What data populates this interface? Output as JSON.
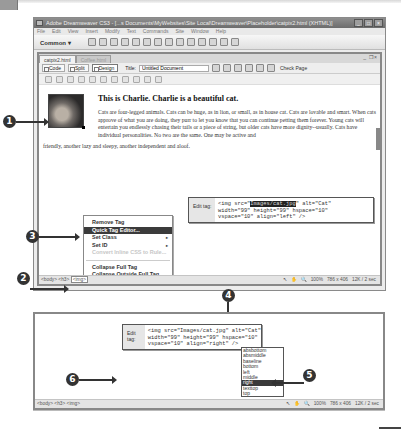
{
  "app": {
    "title": "Adobe Dreamweaver CS3 - [...s Documents\\MyWebsites\\Site Local\\Dreamweaver\\Placeholder\\catpix2.html (XHTML)]",
    "window_buttons": [
      "_",
      "□",
      "×"
    ],
    "menu": [
      "File",
      "Edit",
      "View",
      "Insert",
      "Modify",
      "Text",
      "Commands",
      "Site",
      "Window",
      "Help"
    ],
    "insert_bar": {
      "category": "Common ▾"
    }
  },
  "document": {
    "tabs": [
      {
        "label": "catpix2.html",
        "active": true
      },
      {
        "label": "Coffee.html",
        "active": false
      }
    ],
    "window_controls": "_  ❐ ×",
    "view_buttons": [
      "Code",
      "Split",
      "Design"
    ],
    "active_view": "Design",
    "title_label": "Title:",
    "title_value": "Untitled Document",
    "check_page": "Check Page",
    "heading": "This is Charlie. Charlie is a beautiful cat.",
    "paragraph_wrapped": "Cats are four-legged animals. Cats can be huge, as in lion, or small, as in house cat. Cats are lovable and smart. When cats approve of what you are doing, they purr to let you know that you can continue petting them forever. Young cats will entertain you endlessly chasing their tails or a piece of string, but older cats have more dignity--usually. Cats have individual personalities. No two are the same. One may be active and",
    "paragraph_tail": "friendly, another lazy and sleepy, another independent and aloof.",
    "image_alt": "Cat"
  },
  "quick_tag_editor": {
    "label": "Edit tag:",
    "line1_pre": "<img src=\"",
    "line1_sel": "Images/cat.jpg",
    "line1_post": "\" alt=\"Cat\"",
    "line2": "width=\"99\" height=\"99\" hspace=\"10\"",
    "line3": "vspace=\"10\" align=\"left\" />"
  },
  "context_menu": {
    "items": [
      {
        "label": "Remove Tag",
        "state": "normal"
      },
      {
        "label": "Quick Tag Editor...",
        "state": "highlighted"
      },
      {
        "label": "Set Class",
        "state": "submenu"
      },
      {
        "label": "Set ID",
        "state": "submenu"
      },
      {
        "label": "Convert Inline CSS to Rule...",
        "state": "disabled"
      },
      {
        "label": "Collapse Full Tag",
        "state": "normal"
      },
      {
        "label": "Collapse Outside Full Tag",
        "state": "normal"
      }
    ],
    "submenu_arrow": "▸"
  },
  "status_bar": {
    "tag_selector_1": [
      "<body>",
      "<h3>"
    ],
    "tag_selector_1_current": "<img>",
    "tag_selector_2": "<body> <h3> <img>",
    "zoom": "100%",
    "dimensions": "786 x 406",
    "size_time": "12K / 2 sec"
  },
  "quick_tag_editor_2": {
    "label": "Edit tag:",
    "line1": "<img src=\"Images/cat.jpg\" alt=\"Cat\"",
    "line2": "width=\"99\" height=\"99\" hspace=\"10\"",
    "line3": "vspace=\"10\" align=\"right\" />"
  },
  "align_options": {
    "items": [
      "absbottom",
      "absmiddle",
      "baseline",
      "bottom",
      "left",
      "middle",
      "right",
      "texttop",
      "top"
    ],
    "selected": "right"
  },
  "callouts": [
    "1",
    "2",
    "3",
    "4",
    "5",
    "6"
  ]
}
